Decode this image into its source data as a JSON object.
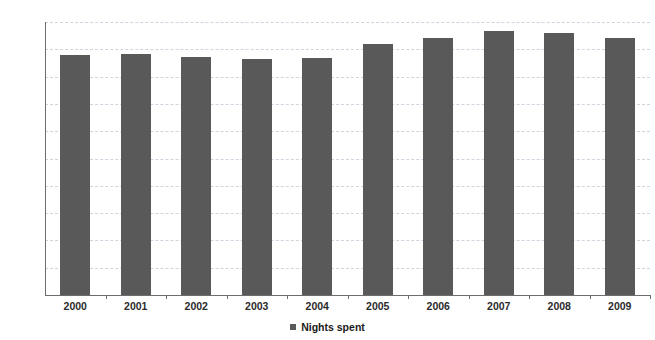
{
  "chart_data": {
    "type": "bar",
    "title": "",
    "xlabel": "",
    "ylabel": "",
    "categories": [
      "2000",
      "2001",
      "2002",
      "2003",
      "2004",
      "2005",
      "2006",
      "2007",
      "2008",
      "2009"
    ],
    "series": [
      {
        "name": "Nights spent",
        "values": [
          1760,
          1763,
          1745,
          1732,
          1740,
          1840,
          1882,
          1937,
          1922,
          1880
        ]
      }
    ],
    "ylim": [
      0,
      2000
    ],
    "yticks": [
      0,
      200,
      400,
      600,
      800,
      1000,
      1200,
      1400,
      1600,
      1800,
      2000
    ],
    "ytick_labels": [
      "0",
      "200",
      "400",
      "600",
      "800",
      "1000",
      "1200",
      "1400",
      "1600",
      "1800",
      "2000"
    ],
    "grid": true,
    "grid_axis": "y",
    "grid_style": "dashed",
    "legend": {
      "position": "bottom-center",
      "entries": [
        {
          "label": "Nights spent",
          "color": "#595959",
          "marker": "square"
        }
      ]
    },
    "colors": {
      "bar": "#595959",
      "grid": "#cfd4de",
      "axis": "#6d6d6d",
      "text": "#2b2b2b",
      "background": "#ffffff"
    }
  }
}
